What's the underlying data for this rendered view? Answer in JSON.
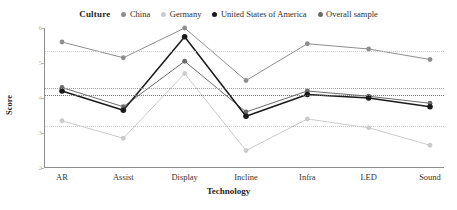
{
  "legend": {
    "title": "Culture",
    "items": [
      {
        "label": "China",
        "color": "#8e8e8e",
        "marker": "legend-dot-china"
      },
      {
        "label": "Germany",
        "color": "#cccccc",
        "marker": "legend-dot-germany"
      },
      {
        "label": "United States of America",
        "color": "#1a1a1a",
        "marker": "legend-dot-usa"
      },
      {
        "label": "Overall sample",
        "color": "#6b6b6b",
        "marker": "legend-dot-overall"
      }
    ]
  },
  "axes": {
    "y_title": "Score",
    "x_title": "Technology",
    "y_ticks": [
      "6",
      "5",
      "4",
      "3",
      "2"
    ]
  },
  "reference_lines": [
    {
      "value": 5.35,
      "style": "light"
    },
    {
      "value": 4.3,
      "style": "mid"
    },
    {
      "value": 4.1,
      "style": "dark"
    },
    {
      "value": 3.2,
      "style": "light"
    }
  ],
  "chart_data": {
    "type": "line",
    "title": "",
    "xlabel": "Technology",
    "ylabel": "Score",
    "categories": [
      "AR",
      "Assist",
      "Display",
      "Incline",
      "Infra",
      "LED",
      "Sound"
    ],
    "ylim": [
      2,
      6
    ],
    "yticks": [
      2,
      3,
      4,
      5,
      6
    ],
    "grid": false,
    "legend_position": "top-center",
    "legend_title": "Culture",
    "series": [
      {
        "name": "China",
        "color": "#8e8e8e",
        "values": [
          5.6,
          5.15,
          6.0,
          4.5,
          5.55,
          5.4,
          5.1
        ]
      },
      {
        "name": "Germany",
        "color": "#cccccc",
        "values": [
          3.35,
          2.85,
          4.7,
          2.5,
          3.4,
          3.15,
          2.65
        ]
      },
      {
        "name": "United States of America",
        "color": "#1a1a1a",
        "values": [
          4.2,
          3.65,
          5.75,
          3.48,
          4.1,
          4.0,
          3.75
        ]
      },
      {
        "name": "Overall sample",
        "color": "#6b6b6b",
        "values": [
          4.3,
          3.75,
          5.05,
          3.6,
          4.2,
          4.05,
          3.85
        ]
      }
    ]
  }
}
